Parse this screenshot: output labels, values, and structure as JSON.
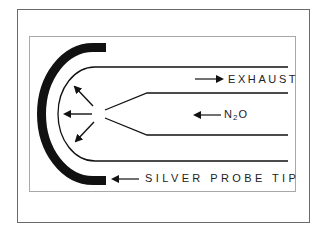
{
  "diagram": {
    "labels": {
      "exhaust": "EXHAUST",
      "n2o_prefix": "N",
      "n2o_sub": "2",
      "n2o_suffix": "O",
      "silver_probe_tip": "SILVER PROBE TIP"
    },
    "flows": [
      {
        "name": "exhaust",
        "direction": "right"
      },
      {
        "name": "N2O",
        "direction": "left"
      },
      {
        "name": "spray",
        "directions": [
          "up-left",
          "left",
          "down-left"
        ]
      }
    ],
    "colors": {
      "ink": "#111111",
      "outer_border": "#6a6a6a",
      "inner_border": "#a8a8a8",
      "background": "#ffffff"
    }
  }
}
